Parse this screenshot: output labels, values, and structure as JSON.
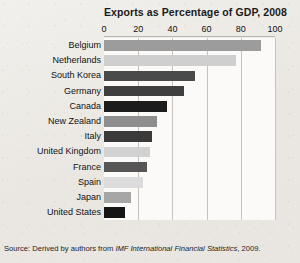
{
  "figure": {
    "title": "Exports as Percentage of GDP, 2008",
    "source_prefix": "Source:  Derived by authors from ",
    "source_publication": "IMF International Financial Statistics",
    "source_suffix": ", 2009."
  },
  "chart_data": {
    "type": "bar",
    "orientation": "horizontal",
    "title": "Exports as Percentage of GDP, 2008",
    "xlabel": "",
    "ylabel": "",
    "xlim": [
      0,
      100
    ],
    "xticks": [
      0,
      20,
      40,
      60,
      80,
      100
    ],
    "xtick_labels": [
      "0",
      "20",
      "40",
      "60",
      "80",
      "100"
    ],
    "grid": true,
    "grid_axis": "x",
    "legend": false,
    "categories": [
      "Belgium",
      "Netherlands",
      "South Korea",
      "Germany",
      "Canada",
      "New Zealand",
      "Italy",
      "United Kingdom",
      "France",
      "Spain",
      "Japan",
      "United States"
    ],
    "values": [
      92,
      77,
      53,
      47,
      37,
      31,
      28,
      27,
      25,
      23,
      16,
      12
    ],
    "bar_colors": [
      "#9c9c9c",
      "#cfcfcf",
      "#4a4a4a",
      "#3f3f3f",
      "#1c1c1c",
      "#8e8e8e",
      "#3a3a3a",
      "#d2d2d2",
      "#565656",
      "#dcdcdc",
      "#a6a6a6",
      "#151515"
    ]
  },
  "colors": {
    "paper": "#efedea",
    "plot_background": "#fbfaf8",
    "gridline": "#c6c3be",
    "text": "#111111"
  }
}
